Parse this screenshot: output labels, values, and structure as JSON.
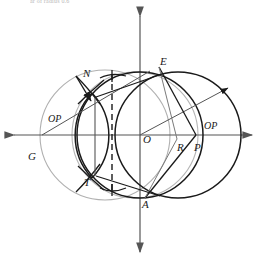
{
  "figure": {
    "type": "geometry-diagram",
    "title_fragment": "ar of radius 0.6",
    "colors": {
      "stroke_dark": "#1a1a1a",
      "stroke_gray": "#a8a8a8",
      "axis": "#555555",
      "background": "#ffffff"
    }
  },
  "axes": {
    "horizontal": {
      "name": "x-axis",
      "y": 135,
      "x_start": 8,
      "x_end": 258,
      "arrows": "both"
    },
    "vertical": {
      "name": "y-axis",
      "x": 140,
      "y_start": 10,
      "y_end": 258,
      "arrows": "both"
    }
  },
  "points": [
    {
      "id": "E",
      "label": "E",
      "x": 159,
      "y": 67,
      "label_x": 160,
      "label_y": 58
    },
    {
      "id": "A",
      "label": "A",
      "x": 145,
      "y": 198,
      "label_x": 143,
      "label_y": 199
    },
    {
      "id": "N",
      "label": "N",
      "x": 92,
      "y": 93,
      "label_x": 84,
      "label_y": 70
    },
    {
      "id": "T",
      "label": "T",
      "x": 92,
      "y": 178,
      "label_x": 84,
      "label_y": 178
    },
    {
      "id": "O",
      "label": "O",
      "x": 140,
      "y": 135,
      "label_x": 143,
      "label_y": 136
    },
    {
      "id": "R",
      "label": "R",
      "x": 177,
      "y": 139,
      "label_x": 178,
      "label_y": 143
    },
    {
      "id": "P",
      "label": "P",
      "x": 196,
      "y": 135,
      "label_x": 194,
      "label_y": 143
    },
    {
      "id": "G",
      "label": "G",
      "x": 42,
      "y": 160,
      "label_x": 28,
      "label_y": 152
    }
  ],
  "segment_labels": [
    {
      "id": "OP-left",
      "label": "OP",
      "label_x": 50,
      "label_y": 115
    },
    {
      "id": "OP-right",
      "label": "OP",
      "label_x": 205,
      "label_y": 122
    }
  ],
  "circles": [
    {
      "id": "circle-G-gray",
      "cx": 105,
      "cy": 135,
      "r": 65,
      "color": "gray"
    },
    {
      "id": "circle-center-dark",
      "cx": 140,
      "cy": 135,
      "r": 63,
      "color": "dark"
    },
    {
      "id": "circle-right-dark",
      "cx": 178,
      "cy": 135,
      "r": 63,
      "color": "dark"
    },
    {
      "id": "circle-inner-gray",
      "cx": 140,
      "cy": 135,
      "r": 63,
      "color": "gray"
    }
  ],
  "construction": {
    "dashed_line": {
      "id": "dashed-vertical",
      "x": 112,
      "y_top": 74,
      "y_bottom": 190
    },
    "solid_vertical": {
      "id": "chord-NT",
      "x": 95,
      "y_top": 97,
      "y_bottom": 177
    },
    "lens_arcs": "vesica formed by two arcs meeting at N and T"
  },
  "top_text": "ar of radius 0.6"
}
